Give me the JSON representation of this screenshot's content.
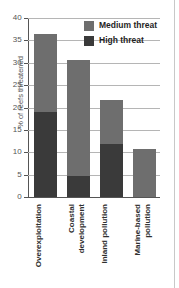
{
  "chart_data": {
    "type": "bar",
    "stacked": true,
    "title": "",
    "xlabel": "",
    "ylabel": "% of reefs threatened",
    "ylim": [
      0,
      40
    ],
    "yticks": [
      0,
      5,
      10,
      15,
      20,
      25,
      30,
      35,
      40
    ],
    "ytick_labels": [
      "0",
      "5",
      "10",
      "15",
      "20",
      "25",
      "30",
      "35",
      "40"
    ],
    "grid": true,
    "legend_position": "top-right",
    "categories": [
      "Overexploitation",
      "Coastal development",
      "Inland pollution",
      "Marine-based pollution"
    ],
    "category_lines": [
      [
        "Overexploitation"
      ],
      [
        "Coastal",
        "development"
      ],
      [
        "Inland pollution"
      ],
      [
        "Marine-based",
        "pollution"
      ]
    ],
    "series": [
      {
        "name": "High threat",
        "color": "#3a3a3a",
        "values": [
          18.9,
          4.8,
          11.8,
          0
        ]
      },
      {
        "name": "Medium threat",
        "color": "#6e6e6e",
        "values": [
          17.6,
          25.9,
          9.9,
          10.7
        ]
      }
    ],
    "totals": [
      36.5,
      30.7,
      21.7,
      10.7
    ]
  },
  "legend": {
    "items": [
      {
        "label": "Medium threat",
        "color": "#6e6e6e"
      },
      {
        "label": "High threat",
        "color": "#3a3a3a"
      }
    ]
  },
  "colors": {
    "medium_threat": "#6e6e6e",
    "high_threat": "#3a3a3a",
    "gridline": "#b5b5b5",
    "axis": "#555555",
    "background": "#ffffff"
  }
}
